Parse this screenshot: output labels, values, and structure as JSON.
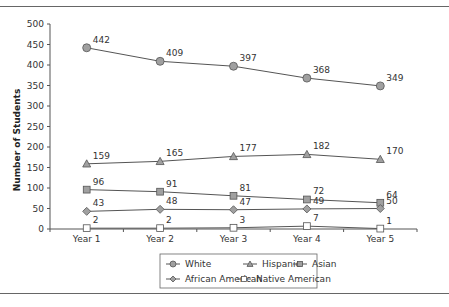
{
  "chart_data": {
    "type": "line",
    "title": "",
    "xlabel": "",
    "ylabel": "Number of Students",
    "ylim": [
      0,
      500
    ],
    "yticks": [
      0,
      50,
      100,
      150,
      200,
      250,
      300,
      350,
      400,
      450,
      500
    ],
    "grid": false,
    "legend_position": "bottom",
    "categories": [
      "Year 1",
      "Year 2",
      "Year 3",
      "Year 4",
      "Year 5"
    ],
    "series": [
      {
        "name": "White",
        "marker": "circle",
        "values": [
          442,
          409,
          397,
          368,
          349
        ]
      },
      {
        "name": "Hispanic",
        "marker": "triangle",
        "values": [
          159,
          165,
          177,
          182,
          170
        ]
      },
      {
        "name": "Asian",
        "marker": "square",
        "values": [
          96,
          91,
          81,
          72,
          64
        ]
      },
      {
        "name": "African American",
        "marker": "diamond",
        "values": [
          43,
          48,
          47,
          49,
          50
        ]
      },
      {
        "name": "Native American",
        "marker": "open-square",
        "values": [
          2,
          2,
          3,
          7,
          1
        ]
      }
    ]
  },
  "colors": {
    "line": "#555555",
    "marker_fill": "#a0a0a0",
    "marker_stroke": "#555555",
    "open_marker_fill": "#ffffff",
    "rule": "#666666"
  }
}
